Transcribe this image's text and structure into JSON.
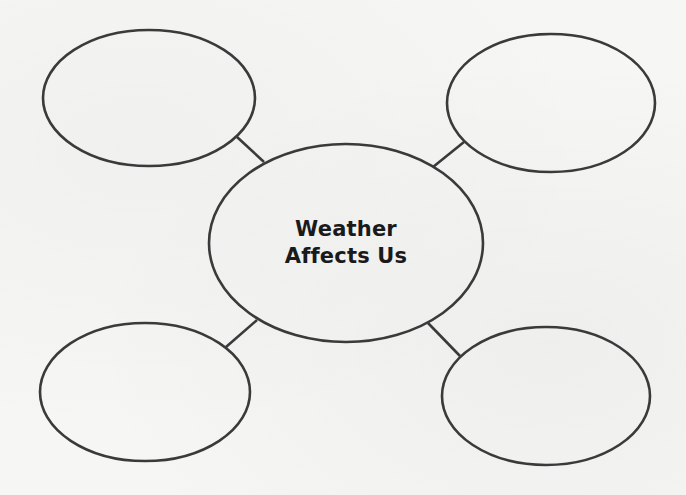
{
  "diagram": {
    "type": "web-organizer",
    "central_node": {
      "line1": "Weather",
      "line2": "Affects Us"
    },
    "outer_nodes": [
      {
        "position": "top-left",
        "text": ""
      },
      {
        "position": "top-right",
        "text": ""
      },
      {
        "position": "bottom-left",
        "text": ""
      },
      {
        "position": "bottom-right",
        "text": ""
      }
    ],
    "colors": {
      "background": "#f6f6f5",
      "stroke": "#3a3a3a",
      "title_text": "#1a1a1a"
    }
  }
}
